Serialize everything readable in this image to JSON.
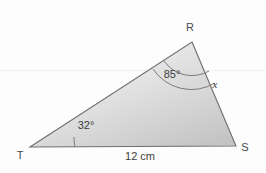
{
  "figure": {
    "type": "geometry-triangle-diagram",
    "background_color": "#fdfdfd",
    "fill_light": "#f2f2f2",
    "fill_dark": "#c6c6c6",
    "stroke_color": "#6e6e6e",
    "vertices": [
      {
        "name": "R",
        "label": "R",
        "x": 192,
        "y": 42,
        "label_x": 190,
        "label_y": 31
      },
      {
        "name": "S",
        "label": "S",
        "x": 236,
        "y": 146,
        "label_x": 245,
        "label_y": 151
      },
      {
        "name": "T",
        "label": "T",
        "x": 30,
        "y": 147,
        "label_x": 20,
        "label_y": 159
      }
    ],
    "angles": [
      {
        "at": "R",
        "label": "85°",
        "value": 85,
        "unit": "degrees",
        "marker": "double-arc",
        "label_x": 172,
        "label_y": 78
      },
      {
        "at": "T",
        "label": "32°",
        "value": 32,
        "unit": "degrees",
        "marker": "single-arc",
        "label_x": 78,
        "label_y": 129
      }
    ],
    "sides": [
      {
        "name": "TS",
        "label": "12 cm",
        "value": 12,
        "unit": "cm",
        "label_x": 140,
        "label_y": 160
      },
      {
        "name": "RS",
        "label": "x",
        "value": null,
        "unit": "",
        "label_x": 215,
        "label_y": 88
      }
    ]
  }
}
